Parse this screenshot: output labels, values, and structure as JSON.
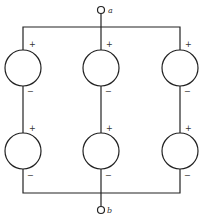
{
  "diagram": {
    "type": "circuit",
    "terminals": {
      "top": {
        "label": "a"
      },
      "bottom": {
        "label": "b"
      }
    },
    "branches": [
      {
        "name": "left",
        "sources": [
          {
            "position": "upper",
            "plus": "+",
            "minus": "−"
          },
          {
            "position": "lower",
            "plus": "+",
            "minus": "−"
          }
        ]
      },
      {
        "name": "middle",
        "sources": [
          {
            "position": "upper",
            "plus": "+",
            "minus": "−"
          },
          {
            "position": "lower",
            "plus": "+",
            "minus": "−"
          }
        ]
      },
      {
        "name": "right",
        "sources": [
          {
            "position": "upper",
            "plus": "+",
            "minus": "−"
          },
          {
            "position": "lower",
            "plus": "+",
            "minus": "−"
          }
        ]
      }
    ]
  }
}
